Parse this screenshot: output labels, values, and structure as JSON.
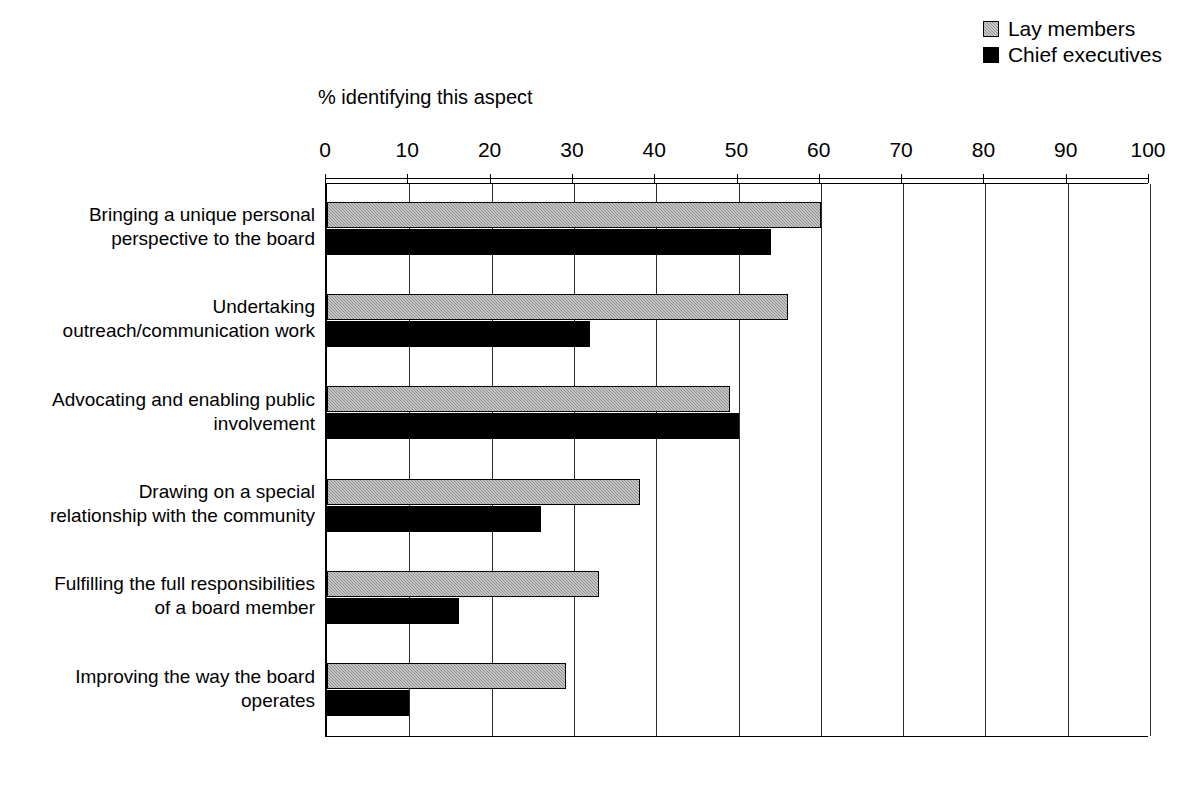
{
  "axis_title": "% identifying this aspect",
  "legend": [
    {
      "label": "Lay members",
      "swatch": "hatched-gray-square-icon",
      "color": "#8d8d8d"
    },
    {
      "label": "Chief executives",
      "swatch": "solid-black-square-icon",
      "color": "#000000"
    }
  ],
  "x_ticks": [
    "0",
    "10",
    "20",
    "30",
    "40",
    "50",
    "60",
    "70",
    "80",
    "90",
    "100"
  ],
  "categories": [
    "Bringing a unique personal perspective to the board",
    "Undertaking outreach/communication work",
    "Advocating and enabling public involvement",
    "Drawing on a special relationship with the community",
    "Fulfilling the full responsibilities of a board member",
    "Improving the way the board operates"
  ],
  "category_lines": [
    [
      "Bringing a unique personal",
      "perspective to the board"
    ],
    [
      "Undertaking",
      "outreach/communication work"
    ],
    [
      "Advocating and enabling public",
      "involvement"
    ],
    [
      "Drawing on a special",
      "relationship with the community"
    ],
    [
      "Fulfilling the full responsibilities",
      "of a board member"
    ],
    [
      "Improving the way the board",
      "operates"
    ]
  ],
  "chart_data": {
    "type": "bar",
    "orientation": "horizontal",
    "title": "",
    "xlabel": "% identifying this aspect",
    "ylabel": "",
    "xlim": [
      0,
      100
    ],
    "xtick_step": 10,
    "grid": true,
    "legend_position": "top-right",
    "categories": [
      "Bringing a unique personal perspective to the board",
      "Undertaking outreach/communication work",
      "Advocating and enabling public involvement",
      "Drawing on a special relationship with the community",
      "Fulfilling the full responsibilities of a board member",
      "Improving the way the board operates"
    ],
    "series": [
      {
        "name": "Lay members",
        "color": "#8d8d8d",
        "values": [
          60,
          56,
          49,
          38,
          33,
          29
        ]
      },
      {
        "name": "Chief executives",
        "color": "#000000",
        "values": [
          54,
          32,
          50,
          26,
          16,
          10
        ]
      }
    ]
  }
}
